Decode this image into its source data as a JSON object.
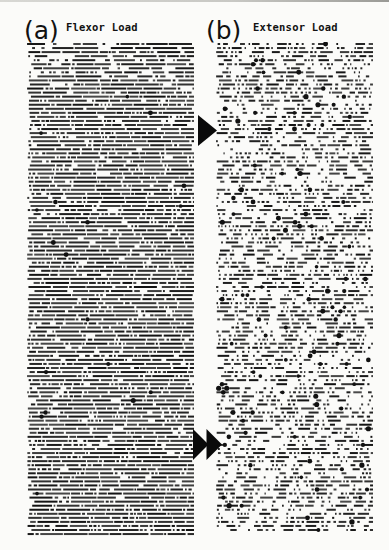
{
  "figure": {
    "panels": [
      {
        "id": "a",
        "label": "(a)",
        "title": "Flexor Load",
        "raster": {
          "x": 27,
          "y": 42,
          "width": 167,
          "height": 494,
          "row_pitch": 4.05,
          "style": "dense",
          "description": "Spike raster of neuron discharge under flexor load; densely packed continuous dash rows with occasional large dots"
        }
      },
      {
        "id": "b",
        "label": "(b)",
        "title": "Extensor Load",
        "raster": {
          "x": 216,
          "y": 42,
          "width": 157,
          "height": 492,
          "row_pitch": 4.05,
          "style": "sparse",
          "description": "Spike raster of neuron discharge under extensor load; broken dash/dot rows with frequent large dots"
        }
      }
    ],
    "markers": [
      {
        "id": "single-arrowhead",
        "type": "single",
        "x": 198,
        "y": 115,
        "width": 19,
        "height": 31,
        "color": "#0a0a0a"
      },
      {
        "id": "double-arrowhead",
        "type": "double",
        "x": 193,
        "y": 429,
        "width": 29,
        "height": 31,
        "color": "#0a0a0a"
      }
    ],
    "colors": {
      "ink": "#111111",
      "paper": "#fbfbf9"
    }
  }
}
